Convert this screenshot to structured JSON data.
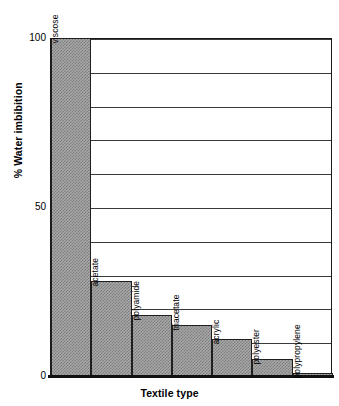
{
  "chart_data": {
    "type": "bar",
    "title": "",
    "xlabel": "Textile type",
    "ylabel": "% Water imbibition",
    "categories": [
      "viscose",
      "acetate",
      "polyamide",
      "triacetate",
      "acrylic",
      "polyester",
      "polypropylene"
    ],
    "values": [
      100,
      28,
      18,
      15,
      11,
      5,
      1
    ],
    "ylim": [
      0,
      100
    ],
    "ytick_labels": [
      "100",
      "50",
      "0"
    ],
    "ytick_values": [
      100,
      50,
      0
    ],
    "gridlines": [
      100,
      90,
      80,
      70,
      60,
      50,
      40,
      30,
      20,
      10
    ],
    "grid": true,
    "legend": "none",
    "bar_fill_color": "#a8a8a8",
    "bar_pattern": "checkerboard-dither",
    "bar_edge_color": "#1f1f1f",
    "axis_color": "#111111",
    "background_color": "#ffffff"
  }
}
